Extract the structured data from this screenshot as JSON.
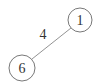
{
  "graph": {
    "nodes": [
      {
        "id": "1",
        "label": "1",
        "cx": 80,
        "cy": 20,
        "r": 12
      },
      {
        "id": "6",
        "label": "6",
        "cx": 22,
        "cy": 68,
        "r": 13
      }
    ],
    "edges": [
      {
        "from": "1",
        "to": "6",
        "weight": "4",
        "x1": 71,
        "y1": 28,
        "x2": 32,
        "y2": 59,
        "label_x": 43,
        "label_y": 39
      }
    ]
  },
  "colors": {
    "stroke": "#555555",
    "edge": "#777777",
    "text": "#333333",
    "background": "#ffffff"
  }
}
